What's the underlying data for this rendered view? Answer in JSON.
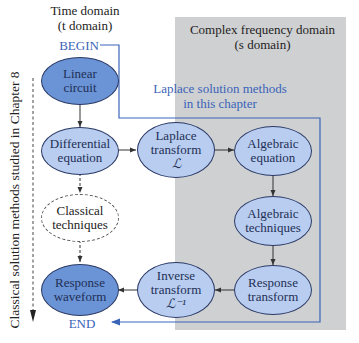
{
  "headers": {
    "time_domain_line1": "Time domain",
    "time_domain_line2": "(t domain)",
    "freq_domain_line1": "Complex frequency domain",
    "freq_domain_line2": "(s domain)"
  },
  "markers": {
    "begin": "BEGIN",
    "end": "END"
  },
  "annotations": {
    "laplace_line1": "Laplace solution methods",
    "laplace_line2": "in this chapter",
    "classical_vertical": "Classical solution methods studied in Chapter 8"
  },
  "nodes": {
    "linear_circuit": {
      "line1": "Linear",
      "line2": "circuit"
    },
    "differential_equation": {
      "line1": "Differential",
      "line2": "equation"
    },
    "classical_techniques": {
      "line1": "Classical",
      "line2": "techniques"
    },
    "response_waveform": {
      "line1": "Response",
      "line2": "waveform"
    },
    "laplace_transform": {
      "line1": "Laplace",
      "line2": "transform",
      "symbol": "ℒ"
    },
    "algebraic_equation": {
      "line1": "Algebraic",
      "line2": "equation"
    },
    "algebraic_techniques": {
      "line1": "Algebraic",
      "line2": "techniques"
    },
    "response_transform": {
      "line1": "Response",
      "line2": "transform"
    },
    "inverse_transform": {
      "line1": "Inverse",
      "line2": "transform",
      "symbol": "ℒ⁻¹"
    }
  },
  "colors": {
    "dark_node": "#6a94d6",
    "light_node": "#b8cdf0",
    "panel": "#cfd0d2",
    "blue_accent": "#3a64b8"
  }
}
